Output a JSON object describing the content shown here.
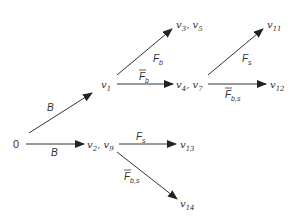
{
  "diagram": {
    "type": "state-transition-tree",
    "nodes": [
      {
        "id": "n0",
        "label": "0"
      },
      {
        "id": "n1",
        "label": "v1",
        "base": "v",
        "sub": "1"
      },
      {
        "id": "n2",
        "label": "v2, v9",
        "base": "v",
        "sub": "2",
        "base2": "v",
        "sub2": "9"
      },
      {
        "id": "n3",
        "label": "v3, v5",
        "base": "v",
        "sub": "3",
        "base2": "v",
        "sub2": "5"
      },
      {
        "id": "n4",
        "label": "v4, v7",
        "base": "v",
        "sub": "4",
        "base2": "v",
        "sub2": "7"
      },
      {
        "id": "n11",
        "label": "v11",
        "base": "v",
        "sub": "11"
      },
      {
        "id": "n12",
        "label": "v12",
        "base": "v",
        "sub": "12"
      },
      {
        "id": "n13",
        "label": "v13",
        "base": "v",
        "sub": "13"
      },
      {
        "id": "n14",
        "label": "v14",
        "base": "v",
        "sub": "14"
      }
    ],
    "edges": [
      {
        "from": "0",
        "to": "v1",
        "label": "B",
        "base": "B",
        "sub": "",
        "overline": false
      },
      {
        "from": "0",
        "to": "v2, v9",
        "label": "B",
        "base": "B",
        "sub": "",
        "overline": false
      },
      {
        "from": "v1",
        "to": "v3, v5",
        "label": "F_b",
        "base": "F",
        "sub": "b",
        "overline": false
      },
      {
        "from": "v1",
        "to": "v4, v7",
        "label": "F̄_b",
        "base": "F",
        "sub": "b",
        "overline": true
      },
      {
        "from": "v4, v7",
        "to": "v11",
        "label": "F_s",
        "base": "F",
        "sub": "s",
        "overline": false
      },
      {
        "from": "v4, v7",
        "to": "v12",
        "label": "F̄_b,s",
        "base": "F",
        "sub": "b,s",
        "overline": true
      },
      {
        "from": "v2, v9",
        "to": "v13",
        "label": "F_s",
        "base": "F",
        "sub": "s",
        "overline": false
      },
      {
        "from": "v2, v9",
        "to": "v14",
        "label": "F̄_b,s",
        "base": "F",
        "sub": "b,s",
        "overline": true
      }
    ],
    "colors": {
      "line": "#333333",
      "background": "#ffffff"
    }
  }
}
